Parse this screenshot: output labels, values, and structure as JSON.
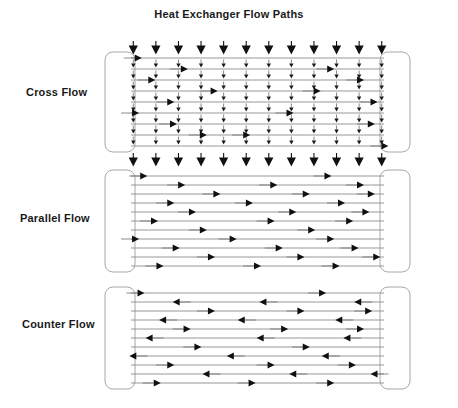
{
  "title": "Heat Exchanger Flow Paths",
  "panels": [
    {
      "id": "cross",
      "label": "Cross Flow",
      "tube_count": 9,
      "shell_flow_direction": "down",
      "tube_flow_direction": "right",
      "top_arrow_count": 12,
      "bottom_arrow_count": 12,
      "internal_tick_columns": 12
    },
    {
      "id": "parallel",
      "label": "Parallel Flow",
      "tube_count": 11,
      "shell_flow_direction": "right",
      "tube_flow_direction": "right",
      "top_arrow_count": 0,
      "bottom_arrow_count": 0,
      "internal_tick_columns": 0
    },
    {
      "id": "counter",
      "label": "Counter Flow",
      "tube_count": 11,
      "shell_flow_direction": "alternating",
      "tube_flow_direction": "alternating",
      "top_arrow_count": 0,
      "bottom_arrow_count": 0,
      "internal_tick_columns": 0
    }
  ],
  "colors": {
    "background": "#ffffff",
    "tube_line": "#8c8c8c",
    "arrow": "#101010",
    "arrow_tail": "#6e6e6e",
    "tank_stroke": "#a8a8a8",
    "text": "#1a1a1a"
  },
  "geometry": {
    "panel_width": 305,
    "tank_width": 30,
    "tank_radius": 8,
    "tube_spacing_cross": 11,
    "tube_spacing_flow": 9
  },
  "flow_arrow_positions": {
    "cross": [
      [
        0.06
      ],
      [
        0.23,
        0.77
      ],
      [
        0.11,
        0.88
      ],
      [
        0.34,
        0.72
      ],
      [
        0.18,
        0.93
      ],
      [
        0.05,
        0.62
      ],
      [
        0.19,
        0.92
      ],
      [
        0.46,
        0.3
      ],
      [
        0.97
      ]
    ],
    "parallel": [
      [
        0.08,
        0.76
      ],
      [
        0.22,
        0.56,
        0.88
      ],
      [
        0.35,
        0.68,
        0.92
      ],
      [
        0.18,
        0.47,
        0.81
      ],
      [
        0.26,
        0.63,
        0.9
      ],
      [
        0.12,
        0.55,
        0.84
      ],
      [
        0.3,
        0.7
      ],
      [
        0.05,
        0.41,
        0.77
      ],
      [
        0.2,
        0.58,
        0.86
      ],
      [
        0.33,
        0.66,
        0.94
      ],
      [
        0.14,
        0.5,
        0.79
      ]
    ],
    "counter": [
      [
        0.07,
        0.74
      ],
      [
        0.2,
        0.52,
        0.87
      ],
      [
        0.33,
        0.66,
        0.91
      ],
      [
        0.15,
        0.44,
        0.8
      ],
      [
        0.24,
        0.6,
        0.88
      ],
      [
        0.1,
        0.51,
        0.83
      ],
      [
        0.28,
        0.68
      ],
      [
        0.04,
        0.4,
        0.75
      ],
      [
        0.18,
        0.55,
        0.85
      ],
      [
        0.31,
        0.63,
        0.93
      ],
      [
        0.13,
        0.48,
        0.77
      ]
    ]
  }
}
